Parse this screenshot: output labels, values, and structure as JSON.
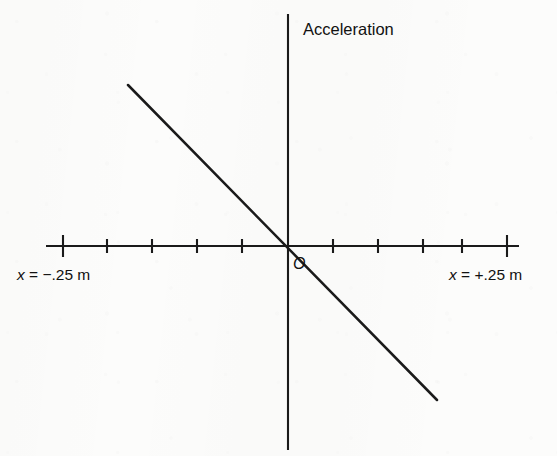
{
  "figure": {
    "title": "Acceleration",
    "origin_label": "O",
    "x_min_label": "x = −.25 m",
    "x_max_label": "x = +.25 m",
    "line_color": "#1a1a1a",
    "axis_color": "#1a1a1a",
    "background_color": "#fcfcfb"
  },
  "chart_data": {
    "type": "line",
    "title": "Acceleration",
    "subtitle": "",
    "xlabel": "",
    "ylabel": "Acceleration",
    "x": [
      -0.25,
      0,
      0.25
    ],
    "y": [
      0.25,
      0,
      -0.25
    ],
    "series": [
      {
        "name": "Acceleration vs displacement",
        "x": [
          -0.2,
          0,
          0.2
        ],
        "values": [
          0.205,
          0,
          -0.205
        ]
      }
    ],
    "annotations": [
      {
        "text": "Acceleration",
        "role": "y-axis-title",
        "x": 0.02,
        "y": 0.92
      },
      {
        "text": "O",
        "role": "origin-marker",
        "x": 0.005,
        "y": -0.03
      },
      {
        "text": "x = −.25 m",
        "role": "x-axis-min-label",
        "x": -0.25,
        "y": -0.04
      },
      {
        "text": "x = +.25 m",
        "role": "x-axis-max-label",
        "x": 0.25,
        "y": -0.04
      }
    ],
    "xlim": [
      -0.27,
      0.27
    ],
    "ylim": [
      -0.29,
      0.29
    ],
    "x_tick_values": [
      -0.25,
      -0.2,
      -0.15,
      -0.1,
      -0.05,
      0.05,
      0.1,
      0.15,
      0.2,
      0.25
    ],
    "x_major_ticks": [
      -0.25,
      0.25
    ],
    "x_tick_labels": [
      "",
      "",
      "",
      "",
      "",
      "",
      "",
      "",
      "",
      ""
    ],
    "y_tick_values": [],
    "y_tick_labels": [],
    "grid": false,
    "legend": null,
    "slope": -1.0,
    "intercept": 0.0,
    "relation": "a = -k x (linear through origin, negative slope)"
  },
  "geometry": {
    "origin_px": {
      "x": 288,
      "y": 246
    },
    "x_axis": {
      "x1": 46,
      "x2": 519,
      "y": 246
    },
    "y_axis": {
      "x": 288,
      "y1": 14,
      "y2": 450
    },
    "ticks_px": [
      63,
      107,
      152,
      197,
      242,
      333,
      378,
      423,
      462,
      507
    ],
    "major_ticks_px": [
      63,
      507
    ],
    "tick_short_half_px": 7,
    "tick_tall_half_px": 11,
    "data_line_px": {
      "x1": 128,
      "y1": 85,
      "x2": 437,
      "y2": 400
    }
  }
}
